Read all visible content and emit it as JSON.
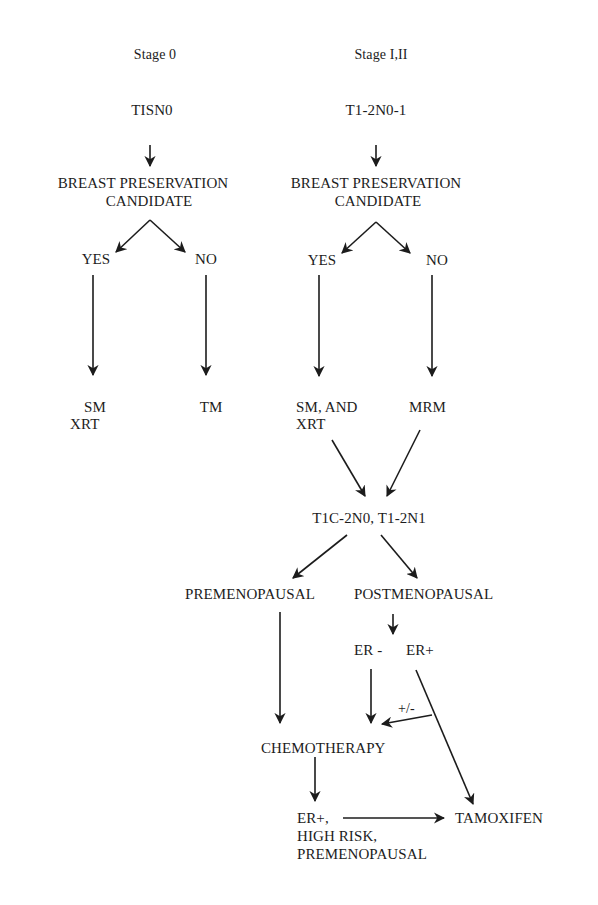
{
  "diagram": {
    "columns": {
      "stage0": {
        "stage_label": "Stage 0",
        "classification": "TISN0",
        "decision_line1": "BREAST PRESERVATION",
        "decision_line2": "CANDIDATE",
        "yes_label": "YES",
        "no_label": "NO",
        "yes_outcome_line1": "SM",
        "yes_outcome_line2": "XRT",
        "no_outcome": "TM"
      },
      "stage1_2": {
        "stage_label": "Stage I,II",
        "classification": "T1-2N0-1",
        "decision_line1": "BREAST PRESERVATION",
        "decision_line2": "CANDIDATE",
        "yes_label": "YES",
        "no_label": "NO",
        "yes_outcome_line1": "SM, AND",
        "yes_outcome_line2": "XRT",
        "no_outcome": "MRM"
      }
    },
    "lower_flow": {
      "merge_node": "T1C-2N0, T1-2N1",
      "premenopausal": "PREMENOPAUSAL",
      "postmenopausal": "POSTMENOPAUSAL",
      "er_negative": "ER -",
      "er_positive": "ER+",
      "optional_label": "+/-",
      "chemotherapy": "CHEMOTHERAPY",
      "final_node_line1": "ER+,",
      "final_node_line2": "HIGH RISK,",
      "final_node_line3": "PREMENOPAUSAL",
      "tamoxifen": "TAMOXIFEN"
    },
    "edges": [
      {
        "from": "TISN0",
        "to": "BREAST PRESERVATION CANDIDATE (Stage 0)"
      },
      {
        "from": "BREAST PRESERVATION CANDIDATE (Stage 0)",
        "to": "YES"
      },
      {
        "from": "BREAST PRESERVATION CANDIDATE (Stage 0)",
        "to": "NO"
      },
      {
        "from": "YES (Stage 0)",
        "to": "SM XRT"
      },
      {
        "from": "NO (Stage 0)",
        "to": "TM"
      },
      {
        "from": "T1-2N0-1",
        "to": "BREAST PRESERVATION CANDIDATE (Stage I,II)"
      },
      {
        "from": "BREAST PRESERVATION CANDIDATE (Stage I,II)",
        "to": "YES"
      },
      {
        "from": "BREAST PRESERVATION CANDIDATE (Stage I,II)",
        "to": "NO"
      },
      {
        "from": "YES (Stage I,II)",
        "to": "SM, AND XRT"
      },
      {
        "from": "NO (Stage I,II)",
        "to": "MRM"
      },
      {
        "from": "SM, AND XRT",
        "to": "T1C-2N0, T1-2N1"
      },
      {
        "from": "MRM",
        "to": "T1C-2N0, T1-2N1"
      },
      {
        "from": "T1C-2N0, T1-2N1",
        "to": "PREMENOPAUSAL"
      },
      {
        "from": "T1C-2N0, T1-2N1",
        "to": "POSTMENOPAUSAL"
      },
      {
        "from": "PREMENOPAUSAL",
        "to": "CHEMOTHERAPY"
      },
      {
        "from": "POSTMENOPAUSAL",
        "to": "ER - / ER+"
      },
      {
        "from": "ER -",
        "to": "CHEMOTHERAPY"
      },
      {
        "from": "ER+",
        "to": "CHEMOTHERAPY",
        "label": "+/-"
      },
      {
        "from": "ER+",
        "to": "TAMOXIFEN"
      },
      {
        "from": "CHEMOTHERAPY",
        "to": "ER+, HIGH RISK, PREMENOPAUSAL"
      },
      {
        "from": "ER+, HIGH RISK, PREMENOPAUSAL",
        "to": "TAMOXIFEN"
      }
    ]
  }
}
